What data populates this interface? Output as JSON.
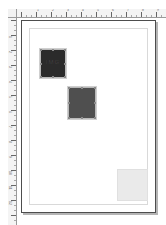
{
  "app": {
    "title": "Page Layout Canvas",
    "canvas_background": "#ffffff",
    "page_background": "#ffffff",
    "page_border_color": "#4d4d4d",
    "margin_guide_color": "#d9d9d9"
  },
  "rulers": {
    "horizontal": {
      "name": "horizontal-ruler",
      "unit": "cm",
      "background": "#f4f4f4",
      "tick_color": "#7d7d7d",
      "labels": [
        "1",
        "2",
        "3",
        "4",
        "5",
        "6",
        "7",
        "8",
        "9"
      ],
      "major_spacing_px": 15,
      "minor_per_major": 3,
      "origin_px": 4
    },
    "vertical": {
      "name": "vertical-ruler",
      "unit": "cm",
      "background": "#f4f4f4",
      "tick_color": "#7d7d7d",
      "labels": [
        "1",
        "2",
        "3",
        "4",
        "5",
        "6",
        "7",
        "8",
        "9",
        "10",
        "11",
        "12"
      ],
      "major_spacing_px": 15,
      "minor_per_major": 3,
      "origin_px": 2
    },
    "corner": {
      "name": "ruler-origin-corner",
      "background": "#f2f2f2"
    }
  },
  "page": {
    "name": "document-page",
    "left_px": 4,
    "top_px": 2,
    "width_px": 135,
    "height_px": 193,
    "margin_px": 7,
    "shadow": "rgba(120,120,120,0.55)"
  },
  "frames": [
    {
      "name": "image-frame-dark",
      "label": "Frame 1",
      "fill": "#2b2b2b",
      "border": "#b9b9b9",
      "selected": true,
      "glyph": "IMG",
      "left_px": 18,
      "top_px": 28,
      "width_px": 26,
      "height_px": 29
    },
    {
      "name": "image-frame-medium",
      "label": "Frame 2",
      "fill": "#4f4f4f",
      "border": "#b9b9b9",
      "selected": true,
      "glyph": "",
      "left_px": 46,
      "top_px": 66,
      "width_px": 28,
      "height_px": 32
    },
    {
      "name": "image-frame-light",
      "label": "Frame 3",
      "fill": "#eaeaea",
      "border": "#e0e0e0",
      "selected": false,
      "glyph": "",
      "left_px": 95,
      "top_px": 148,
      "width_px": 31,
      "height_px": 32
    }
  ]
}
